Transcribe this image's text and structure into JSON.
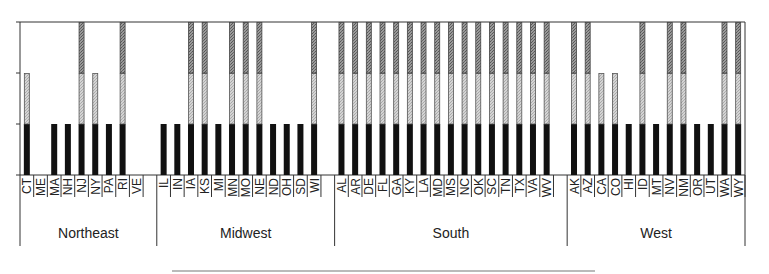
{
  "chart_data": {
    "type": "bar",
    "stacked": true,
    "title": "",
    "xlabel": "",
    "ylabel": "",
    "ylim": [
      0,
      3
    ],
    "yticks": [
      0,
      1,
      2,
      3
    ],
    "ytick_labels_visible": false,
    "grid": false,
    "legend": null,
    "segment_colors": {
      "segment_1": "#111111",
      "segment_2": "#c8c8c8",
      "segment_3": "#8a8a8a"
    },
    "groups": [
      {
        "name": "Northeast",
        "categories": [
          "CT",
          "ME",
          "MA",
          "NH",
          "NJ",
          "NY",
          "PA",
          "RI",
          "VE"
        ],
        "values": [
          2,
          0,
          1,
          1,
          3,
          2,
          1,
          3,
          0
        ]
      },
      {
        "name": "Midwest",
        "categories": [
          "IL",
          "IN",
          "IA",
          "KS",
          "MI",
          "MN",
          "MO",
          "NE",
          "ND",
          "OH",
          "SD",
          "WI"
        ],
        "values": [
          1,
          1,
          3,
          3,
          1,
          3,
          3,
          3,
          1,
          1,
          1,
          3
        ]
      },
      {
        "name": "South",
        "categories": [
          "AL",
          "AR",
          "DE",
          "FL",
          "GA",
          "KY",
          "LA",
          "MD",
          "MS",
          "NC",
          "OK",
          "SC",
          "TN",
          "TX",
          "VA",
          "WV"
        ],
        "values": [
          3,
          3,
          3,
          3,
          3,
          3,
          3,
          3,
          3,
          3,
          3,
          3,
          3,
          3,
          3,
          3
        ]
      },
      {
        "name": "West",
        "categories": [
          "AK",
          "AZ",
          "CA",
          "CO",
          "HI",
          "ID",
          "MT",
          "NV",
          "NM",
          "OR",
          "UT",
          "WA",
          "WY"
        ],
        "values": [
          3,
          3,
          2,
          2,
          1,
          3,
          1,
          3,
          3,
          1,
          1,
          3,
          3
        ]
      }
    ]
  }
}
